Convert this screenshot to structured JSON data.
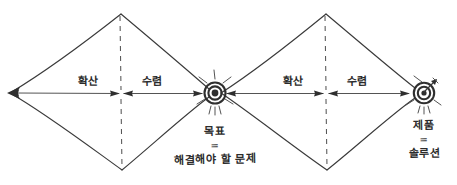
{
  "diagram": {
    "style": "hand-drawn pencil sketch on white paper",
    "ink_color": "#3a3a3a",
    "background_color": "#ffffff",
    "diamonds": [
      {
        "id": "diamond-1",
        "phases": [
          {
            "id": "phase-1-diverge",
            "label": "확산"
          },
          {
            "id": "phase-1-converge",
            "label": "수렴"
          }
        ]
      },
      {
        "id": "diamond-2",
        "phases": [
          {
            "id": "phase-2-diverge",
            "label": "확산"
          },
          {
            "id": "phase-2-converge",
            "label": "수렴"
          }
        ]
      }
    ],
    "nodes": [
      {
        "id": "node-start",
        "icon": "arrowhead-left-icon",
        "caption_line1": "",
        "caption_equals": "",
        "caption_line2": ""
      },
      {
        "id": "node-goal",
        "icon": "bullseye-target-icon",
        "caption_line1": "목표",
        "caption_equals": "=",
        "caption_line2": "해결해야 할 문제"
      },
      {
        "id": "node-product",
        "icon": "bullseye-target-with-dart-icon",
        "caption_line1": "제품",
        "caption_equals": "=",
        "caption_line2": "솔루션"
      }
    ]
  }
}
